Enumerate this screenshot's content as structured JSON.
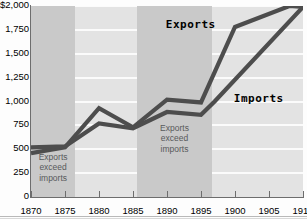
{
  "chart_data": {
    "type": "line",
    "title": "",
    "xlabel": "",
    "ylabel": "",
    "xlim": [
      1870,
      1910
    ],
    "ylim": [
      0,
      2000
    ],
    "grid": true,
    "legend_position": "inline-annotation",
    "x": [
      1870,
      1875,
      1880,
      1885,
      1890,
      1895,
      1900,
      1905,
      1910
    ],
    "y_ticks": [
      0,
      250,
      500,
      750,
      1000,
      1250,
      1500,
      1750,
      2000
    ],
    "y_tick_labels": [
      "0",
      "250",
      "500",
      "750",
      "1,000",
      "1,250",
      "1,500",
      "1,750",
      "$2,000"
    ],
    "x_tick_labels": [
      "1870",
      "1875",
      "1880",
      "1885",
      "1890",
      "1895",
      "1900",
      "1905",
      "1910"
    ],
    "series": [
      {
        "name": "Exports",
        "x": [
          1870,
          1875,
          1880,
          1885,
          1890,
          1895,
          1900,
          1908,
          1910
        ],
        "values": [
          460,
          520,
          930,
          730,
          1020,
          990,
          1780,
          2000,
          1990
        ]
      },
      {
        "name": "Imports",
        "x": [
          1870,
          1875,
          1880,
          1885,
          1890,
          1895,
          1897,
          1910
        ],
        "values": [
          520,
          530,
          770,
          720,
          890,
          860,
          1000,
          1990
        ]
      }
    ],
    "annotations": [
      {
        "name": "exports-series-label",
        "text": "Exports",
        "x_year": 1893.5,
        "y_value": 1800
      },
      {
        "name": "imports-series-label",
        "text": "Imports",
        "x_year": 1903.5,
        "y_value": 1030
      }
    ],
    "shaded_bands": [
      {
        "name": "band-1870-1876",
        "label": "Exports\nexceed\nimports",
        "label_lines": [
          "Exports",
          "exceed",
          "imports"
        ],
        "x_start": 1870,
        "x_end": 1876.5
      },
      {
        "name": "band-1885-1896",
        "label": "Exports\nexceed\nimports",
        "label_lines": [
          "Exports",
          "exceed",
          "imports"
        ],
        "x_start": 1885.6,
        "x_end": 1896.6
      }
    ],
    "colors": {
      "plot_background": "#e3e3e3",
      "band_fill": "#c9c9c9",
      "gridline": "#fbfbfb",
      "series_line": "#4d4d4d",
      "axis": "#6d6d6d",
      "tick_text": "#000000",
      "band_text": "#58595b"
    }
  }
}
